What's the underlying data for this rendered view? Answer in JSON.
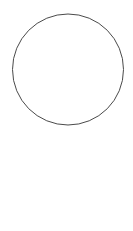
{
  "figure": {
    "width": 133,
    "height": 231,
    "background_color": "#ffffff"
  },
  "colors": {
    "stroke_dark": "#1a1a1a",
    "stroke_mid": "#4a4a4a",
    "stroke_light": "#8c8c8c",
    "stroke_faint": "#b0b0b0",
    "point_fill_solid": "#111111",
    "point_fill_hollow": "#ffffff",
    "label_color": "#1a1a1a"
  },
  "circle": {
    "label": "circumcircle",
    "cx": 68,
    "cy": 69.5,
    "r": 55.5,
    "stroke": "#4a4a4a",
    "stroke_width": 1
  },
  "points": [
    {
      "id": "C",
      "label": "C",
      "x": 72.5,
      "y": 45.5,
      "style": "filled",
      "label_x": 63,
      "label_y": 43
    },
    {
      "id": "P",
      "label": "P",
      "x": 55.5,
      "y": 74.5,
      "style": "hollow",
      "label_x": 42,
      "label_y": 74
    },
    {
      "id": "B",
      "label": "B",
      "x": 40.5,
      "y": 96.5,
      "style": "hollow",
      "label_x": 37,
      "label_y": 112
    },
    {
      "id": "Q",
      "label": "Q",
      "x": 62.0,
      "y": 95.5,
      "style": "hollow",
      "label_x": 64,
      "label_y": 110
    },
    {
      "id": "H",
      "label": "H",
      "x": 88.0,
      "y": 93.5,
      "style": "hollow",
      "label_x": 93,
      "label_y": 88
    },
    {
      "id": "A",
      "label": "A",
      "x": 105.5,
      "y": 92.0,
      "style": "filled",
      "label_x": 104,
      "label_y": 105
    }
  ],
  "segment_labels": [
    {
      "id": "h",
      "label": "h",
      "x": 94,
      "y": 61
    }
  ],
  "solid_segments": [
    {
      "name": "segment-B-C",
      "x1": 40.5,
      "y1": 96.5,
      "x2": 88.0,
      "y2": 20.0,
      "width": 1.8,
      "stroke": "#1a1a1a"
    },
    {
      "name": "segment-B-A",
      "x1": 40.5,
      "y1": 96.5,
      "x2": 122.0,
      "y2": 89.0,
      "width": 1.8,
      "stroke": "#1a1a1a"
    },
    {
      "name": "altitude-h-vertical",
      "x1": 88.0,
      "y1": 20.0,
      "x2": 88.0,
      "y2": 124.0,
      "width": 1.8,
      "stroke": "#1a1a1a"
    }
  ],
  "thin_segments": [
    {
      "name": "cevian-C-to-apex",
      "x1": 60.0,
      "y1": 36.0,
      "x2": 83.0,
      "y2": 214.0,
      "width": 0.8,
      "stroke": "#6e6e6e"
    },
    {
      "name": "cevian-P-to-apex",
      "x1": 55.5,
      "y1": 74.5,
      "x2": 83.0,
      "y2": 214.0,
      "width": 0.8,
      "stroke": "#6e6e6e"
    },
    {
      "name": "cevian-Q-to-apex",
      "x1": 62.0,
      "y1": 95.5,
      "x2": 83.0,
      "y2": 214.0,
      "width": 0.8,
      "stroke": "#6e6e6e"
    },
    {
      "name": "segment-P-Q",
      "x1": 55.5,
      "y1": 74.5,
      "x2": 62.0,
      "y2": 95.5,
      "width": 0.8,
      "stroke": "#8c8c8c"
    },
    {
      "name": "segment-Q-H",
      "x1": 62.0,
      "y1": 95.5,
      "x2": 88.0,
      "y2": 93.5,
      "width": 0.8,
      "stroke": "#8c8c8c"
    }
  ],
  "dashed_segments": [
    {
      "name": "dashed-extension-left-of-B",
      "x1": 40.5,
      "y1": 96.5,
      "x2": 16.0,
      "y2": 92.5,
      "width": 0.8,
      "stroke": "#9a9a9a",
      "dash": "2.5,2"
    },
    {
      "name": "dashed-tangent-left",
      "x1": 19.0,
      "y1": 92.5,
      "x2": 83.0,
      "y2": 214.0,
      "width": 0.8,
      "stroke": "#9a9a9a",
      "dash": "3,2.5"
    },
    {
      "name": "dashed-tangent-right",
      "x1": 122.0,
      "y1": 89.0,
      "x2": 83.0,
      "y2": 214.0,
      "width": 0.8,
      "stroke": "#9a9a9a",
      "dash": "3,2.5"
    }
  ],
  "right_angle_marks": [
    {
      "name": "right-angle-at-P",
      "x": 55.5,
      "y": 74.5,
      "rot": 18
    },
    {
      "name": "right-angle-at-Q-left",
      "x": 62.0,
      "y": 95.5,
      "rot": 0
    },
    {
      "name": "right-angle-at-Q-right",
      "x": 73.0,
      "y": 94.8,
      "rot": 0
    },
    {
      "name": "right-angle-at-H",
      "x": 88.0,
      "y": 93.5,
      "rot": 0
    }
  ],
  "apex": {
    "name": "apex-convergence-point",
    "x": 83,
    "y": 214,
    "description": "point where all cevians and tangent lines converge"
  }
}
